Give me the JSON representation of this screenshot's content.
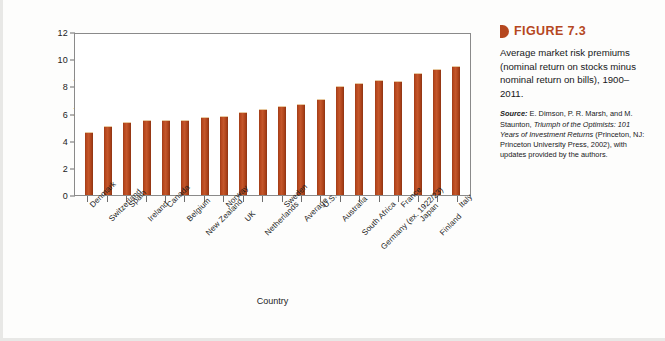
{
  "figure": {
    "marker_icon": "triangle-marker-icon",
    "number_label": "FIGURE 7.3",
    "caption": "Average market risk premiums (nominal return on stocks minus nominal return on bills), 1900–2011.",
    "source_label": "Source:",
    "source_text_1": " E. Dimson, P. R. Marsh, and M. Staunton, ",
    "source_italic_1": "Triumph of the Optimists: 101 Years of Investment Returns",
    "source_text_2": " (Princeton, NJ: Princeton University Press, 2002), with updates provided by the authors."
  },
  "colors": {
    "bar": "#b5471f",
    "bar_dark": "#8d3413",
    "bar_light": "#c4572b",
    "accent": "#b5471f",
    "axis": "#6d6d6d",
    "frame": "#8a8a8a",
    "text": "#1d1d1d",
    "background": "#fdfdfc"
  },
  "chart_data": {
    "type": "bar",
    "title": "Average market risk premiums (nominal return on stocks minus nominal return on bills), 1900–2011.",
    "xlabel": "Country",
    "ylabel": "Risk premium, %",
    "ylim": [
      0,
      12
    ],
    "yticks": [
      0,
      2,
      4,
      6,
      8,
      10,
      12
    ],
    "ytick_labels": [
      "0",
      "2",
      "4",
      "6",
      "8",
      "10",
      "12"
    ],
    "grid": false,
    "legend": "none",
    "categories": [
      "Denmark",
      "Switzerland",
      "Spain",
      "Ireland",
      "Canada",
      "Belgium",
      "New Zealand",
      "Norway",
      "UK",
      "Netherlands",
      "Sweden",
      "Average",
      "U.S.",
      "Australia",
      "South Africa",
      "Germany (ex. 1922/23)",
      "France",
      "Japan",
      "Finland",
      "Italy"
    ],
    "values": [
      4.65,
      5.05,
      5.4,
      5.5,
      5.55,
      5.5,
      5.75,
      5.85,
      6.1,
      6.3,
      6.55,
      6.7,
      7.05,
      8.05,
      8.25,
      8.45,
      8.4,
      8.95,
      9.3,
      9.5
    ],
    "label_rows": [
      0,
      1,
      0,
      1,
      0,
      1,
      2,
      0,
      1,
      2,
      0,
      1,
      0,
      1,
      2,
      3,
      0,
      1,
      2,
      0
    ]
  }
}
